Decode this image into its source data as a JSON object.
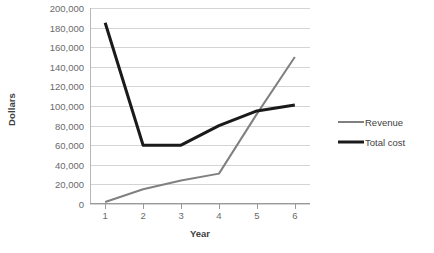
{
  "chart_data": {
    "type": "line",
    "title": "",
    "xlabel": "Year",
    "ylabel": "Dollars",
    "x": [
      1,
      2,
      3,
      4,
      5,
      6
    ],
    "xticklabels": [
      "1",
      "2",
      "3",
      "4",
      "5",
      "6"
    ],
    "xlim": [
      0.6,
      6.4
    ],
    "ylim": [
      0,
      200000
    ],
    "yticks": [
      0,
      20000,
      40000,
      60000,
      80000,
      100000,
      120000,
      140000,
      160000,
      180000,
      200000
    ],
    "yticklabels": [
      "0",
      "20,000",
      "40,000",
      "60,000",
      "80,000",
      "100,000",
      "120,000",
      "140,000",
      "160,000",
      "180,000",
      "200,000"
    ],
    "grid": "horizontal",
    "legend_position": "right",
    "series": [
      {
        "name": "Revenue",
        "color": "#808080",
        "width": 2,
        "values": [
          2000,
          15000,
          24000,
          31000,
          92000,
          150000
        ]
      },
      {
        "name": "Total cost",
        "color": "#1a1a1a",
        "width": 3,
        "values": [
          185000,
          60000,
          60000,
          80000,
          95000,
          101000
        ]
      }
    ]
  },
  "legend": {
    "items": [
      {
        "label": "Revenue"
      },
      {
        "label": "Total cost"
      }
    ]
  },
  "colors": {
    "revenue": "#808080",
    "total_cost": "#1a1a1a",
    "gridline": "#d4d4d4",
    "axis": "#9a9a9a",
    "text": "#6a6a6a",
    "background": "#ffffff"
  }
}
